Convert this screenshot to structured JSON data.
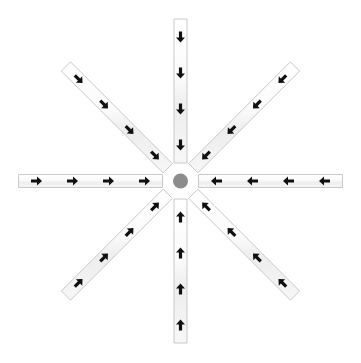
{
  "figure": {
    "background_color": "#ffffff",
    "width": 361,
    "height": 363
  },
  "hub": {
    "name": "center-hub",
    "center_x": 180.5,
    "center_y": 181,
    "radius": 7.5,
    "ring_radius": 11,
    "fill_color": "#8c8c8c",
    "ring_color": "#ffffff"
  },
  "style": {
    "arm_fill": "#fafafa",
    "arm_fill_alt": "#f2f2f2",
    "arm_border": "#c9c9c9",
    "arrow_color": "#101010",
    "arm_width": 13,
    "arrow_count_per_arm": 4,
    "arrow_length": 11,
    "arrow_head_width": 9
  },
  "chart_data": {
    "type": "diagram",
    "layout": "8-spoke radial star",
    "arm_count": 8,
    "arrows_per_arm": 4,
    "total_arrows": 32,
    "flow_direction": "inward",
    "arms": [
      {
        "id": "arm-e",
        "label": "East arm",
        "angle_deg": 0,
        "direction_label": "left",
        "flow": "inward",
        "inner_radius": 18,
        "outer_radius": 162,
        "arrows": 4
      },
      {
        "id": "arm-se",
        "label": "Southeast arm",
        "angle_deg": 45,
        "direction_label": "up-left",
        "flow": "inward",
        "inner_radius": 18,
        "outer_radius": 162,
        "arrows": 4
      },
      {
        "id": "arm-s",
        "label": "South arm",
        "angle_deg": 90,
        "direction_label": "up",
        "flow": "inward",
        "inner_radius": 18,
        "outer_radius": 162,
        "arrows": 4
      },
      {
        "id": "arm-sw",
        "label": "Southwest arm",
        "angle_deg": 135,
        "direction_label": "up-right",
        "flow": "inward",
        "inner_radius": 18,
        "outer_radius": 162,
        "arrows": 4
      },
      {
        "id": "arm-w",
        "label": "West arm",
        "angle_deg": 180,
        "direction_label": "right",
        "flow": "inward",
        "inner_radius": 18,
        "outer_radius": 162,
        "arrows": 4
      },
      {
        "id": "arm-nw",
        "label": "Northwest arm",
        "angle_deg": 225,
        "direction_label": "down-right",
        "flow": "inward",
        "inner_radius": 18,
        "outer_radius": 162,
        "arrows": 4
      },
      {
        "id": "arm-n",
        "label": "North arm",
        "angle_deg": 270,
        "direction_label": "down",
        "flow": "inward",
        "inner_radius": 18,
        "outer_radius": 162,
        "arrows": 4
      },
      {
        "id": "arm-ne",
        "label": "Northeast arm",
        "angle_deg": 315,
        "direction_label": "down-left",
        "flow": "inward",
        "inner_radius": 18,
        "outer_radius": 162,
        "arrows": 4
      }
    ]
  }
}
